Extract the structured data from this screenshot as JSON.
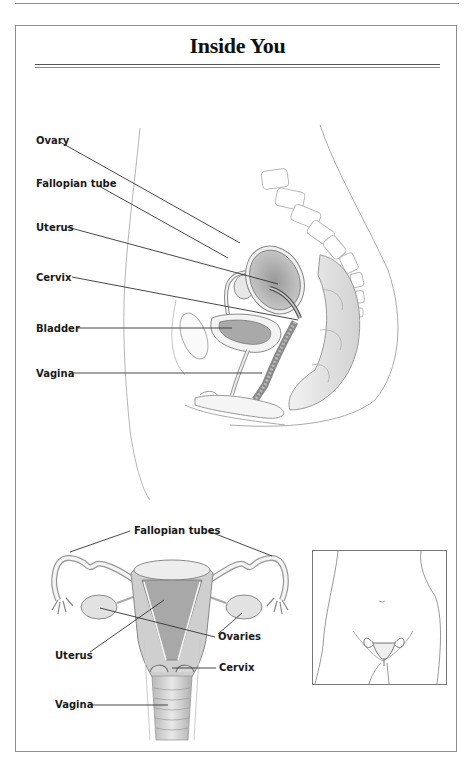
{
  "page": {
    "title": "Inside You"
  },
  "side_view": {
    "labels": [
      {
        "id": "ovary",
        "text": "Ovary"
      },
      {
        "id": "fallopian_tube",
        "text": "Fallopian tube"
      },
      {
        "id": "uterus",
        "text": "Uterus"
      },
      {
        "id": "cervix",
        "text": "Cervix"
      },
      {
        "id": "bladder",
        "text": "Bladder"
      },
      {
        "id": "vagina",
        "text": "Vagina"
      }
    ]
  },
  "front_view": {
    "labels": [
      {
        "id": "fallopian_tubes",
        "text": "Fallopian tubes"
      },
      {
        "id": "ovaries",
        "text": "Ovaries"
      },
      {
        "id": "uterus",
        "text": "Uterus"
      },
      {
        "id": "cervix",
        "text": "Cervix"
      },
      {
        "id": "vagina",
        "text": "Vagina"
      }
    ]
  },
  "inset": {
    "description": "Torso outline showing reproductive organ location"
  },
  "colors": {
    "line": "#3a3a3a",
    "frame": "#8e8e8e",
    "organ_fill": "#bdbdbd",
    "organ_dark": "#8f8f8f"
  }
}
